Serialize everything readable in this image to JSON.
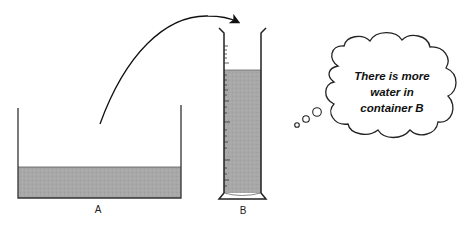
{
  "diagram": {
    "container_a": {
      "label": "A",
      "water_color": "#a9a9a9"
    },
    "container_b": {
      "label": "B",
      "water_color": "#a9a9a9"
    },
    "arrow": {
      "from": "container_a",
      "to": "container_b"
    },
    "thought_bubble": {
      "lines": [
        "There is more",
        "water in",
        "container B"
      ]
    }
  }
}
